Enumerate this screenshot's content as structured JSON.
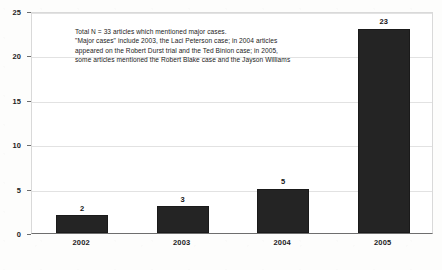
{
  "chart_data": {
    "type": "bar",
    "title": "",
    "subtitle": "",
    "xlabel": "",
    "ylabel": "",
    "categories": [
      "2002",
      "2003",
      "2004",
      "2005"
    ],
    "values": [
      2,
      3,
      5,
      23
    ],
    "value_labels": [
      "2",
      "3",
      "5",
      "23"
    ],
    "ylim": [
      0,
      25
    ],
    "yticks": [
      0,
      5,
      10,
      15,
      20,
      25
    ],
    "ytick_labels": [
      "0",
      "5",
      "10",
      "15",
      "20",
      "25"
    ],
    "grid": "horizontal",
    "legend": "none",
    "series": [
      {
        "name": "Articles mentioning major cases",
        "values": [
          2,
          3,
          5,
          23
        ],
        "color": "#242424",
        "pattern": "dotted-fill"
      }
    ],
    "annotations": [
      "Total N = 33 articles which mentioned major cases.",
      "\"Major cases\" include 2003, the Laci Peterson case; in 2004 articles",
      "appeared on the Robert Durst trial and the Ted Binion case; in 2005,",
      "some articles mentioned the Robert Blake case and the Jayson Williams"
    ]
  },
  "colors": {
    "bar": "#242424",
    "gridline": "#e2e2e2",
    "axis": "#6e6e6e",
    "text": "#1c1c1c",
    "plot_background": "#ffffff",
    "page_background": "#fdfdfc"
  }
}
